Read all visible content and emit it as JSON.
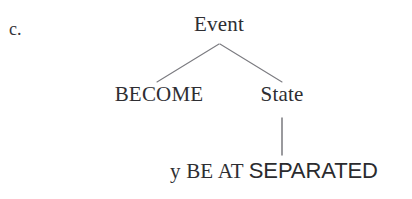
{
  "figure": {
    "example_label": "c.",
    "line_color": "#7b7b80",
    "text_color": "#2e2e32",
    "background": "#ffffff"
  },
  "tree": {
    "root": {
      "label": "Event"
    },
    "children": [
      {
        "label": "BECOME"
      },
      {
        "label": "State"
      }
    ],
    "leaf": {
      "serif_part": "y BE AT",
      "sans_part": "SEPARATED",
      "full_text": "y BE AT SEPARATED"
    }
  },
  "edges": [
    {
      "name": "event-to-become",
      "from": "Event",
      "to": "BECOME"
    },
    {
      "name": "event-to-state",
      "from": "Event",
      "to": "State"
    },
    {
      "name": "state-to-leaf",
      "from": "State",
      "to": "y BE AT SEPARATED"
    }
  ]
}
